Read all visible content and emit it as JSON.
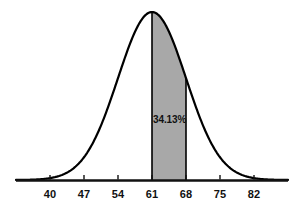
{
  "chart_data": {
    "type": "area",
    "title": "",
    "subtitle": "",
    "xlabel": "",
    "ylabel": "",
    "distribution": "normal",
    "mean": 61,
    "std_dev": 7,
    "xlim": [
      33,
      89
    ],
    "ylim": [
      0,
      1
    ],
    "grid": false,
    "legend": null,
    "axis_ticks": [
      40,
      47,
      54,
      61,
      68,
      75,
      82
    ],
    "tick_labels": [
      "40",
      "47",
      "54",
      "61",
      "68",
      "75",
      "82"
    ],
    "shaded_region": {
      "from": 61,
      "to": 68,
      "label": "34.13%",
      "fill_color": "#a8a8a8",
      "sigma_span": "0 to +1"
    },
    "curve_color": "#000000",
    "axis_color": "#111111",
    "background_color": "#ffffff",
    "annotations": [
      {
        "text": "34.13%",
        "x": 64.5,
        "y_fraction": 0.36
      }
    ]
  },
  "axis": {
    "ticks": [
      {
        "label": "40",
        "value": 40
      },
      {
        "label": "47",
        "value": 47
      },
      {
        "label": "54",
        "value": 54
      },
      {
        "label": "61",
        "value": 61
      },
      {
        "label": "68",
        "value": 68
      },
      {
        "label": "75",
        "value": 75
      },
      {
        "label": "82",
        "value": 82
      }
    ]
  }
}
